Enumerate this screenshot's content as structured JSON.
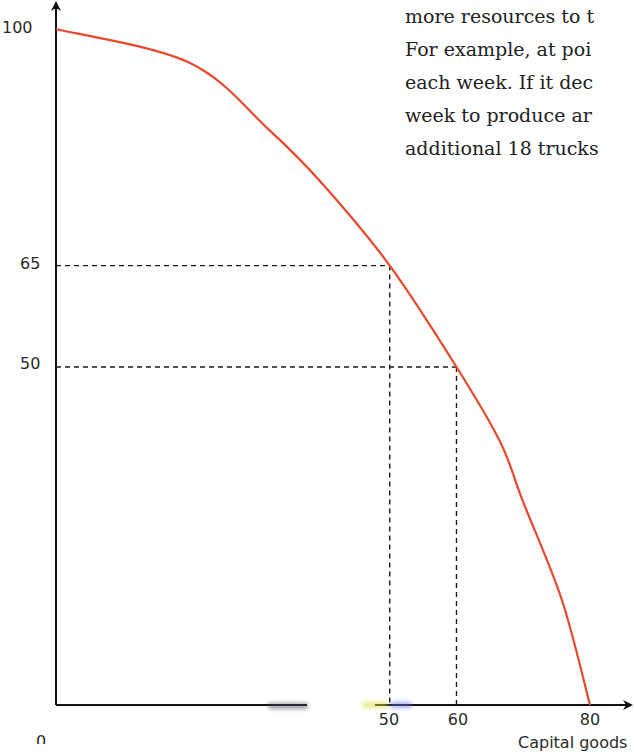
{
  "chart_data": {
    "type": "line",
    "title": "",
    "xlabel": "Capital goods",
    "ylabel": "",
    "xlim": [
      0,
      80
    ],
    "ylim": [
      0,
      100
    ],
    "grid": false,
    "legend": null,
    "x_ticks": [
      "50",
      "60",
      "80"
    ],
    "y_ticks": [
      "100",
      "65",
      "50"
    ],
    "origin_label": "0",
    "series": [
      {
        "name": "Production possibility frontier",
        "color": "#e8472a",
        "points": [
          {
            "x": 0,
            "y": 100
          },
          {
            "x": 20,
            "y": 95
          },
          {
            "x": 32,
            "y": 85
          },
          {
            "x": 40,
            "y": 77
          },
          {
            "x": 50,
            "y": 65
          },
          {
            "x": 60,
            "y": 50
          },
          {
            "x": 66.5,
            "y": 39
          },
          {
            "x": 70,
            "y": 30
          },
          {
            "x": 75.8,
            "y": 15.5
          },
          {
            "x": 80,
            "y": 0
          }
        ]
      }
    ],
    "reference_lines": [
      {
        "point": {
          "x": 50,
          "y": 65
        },
        "style": "dashed"
      },
      {
        "point": {
          "x": 60,
          "y": 50
        },
        "style": "dashed"
      }
    ]
  },
  "text_block": {
    "lines": [
      "more resources to t",
      "For example, at poi",
      "each week. If it dec",
      "week to produce ar",
      "additional 18 trucks"
    ]
  },
  "colors": {
    "curve": "#e8472a",
    "axis": "#111111",
    "dash": "#1a1a1a",
    "text": "#222222"
  }
}
